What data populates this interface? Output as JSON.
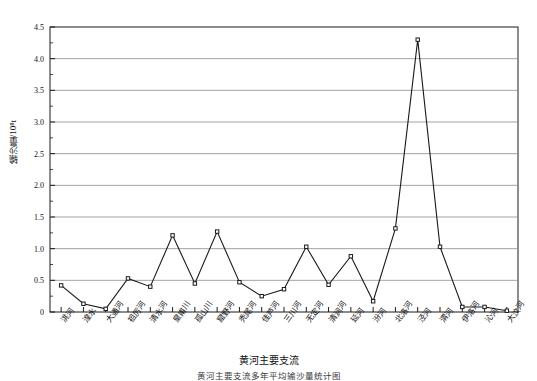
{
  "chart_data": {
    "type": "line",
    "title": "",
    "xlabel": "黄河主要支流",
    "ylabel": "输沙量/10⁸t",
    "ylim": [
      0,
      4.5
    ],
    "ytick_step": 0.5,
    "yminor_step": 0.25,
    "grid": "horizontal",
    "legend": "none",
    "marker": "open-square",
    "line_color": "#1a1a1a",
    "grid_color": "#8c8c8c",
    "categories": [
      "洮河",
      "湟水",
      "大通河",
      "祖厉河",
      "清水河",
      "皇甫川",
      "孤山川",
      "窟野河",
      "秃尾河",
      "佳芦河",
      "三川河",
      "无定河",
      "清涧河",
      "延河",
      "汾河",
      "北洛河",
      "泾河",
      "渭河",
      "伊洛河",
      "沁河",
      "大汶河"
    ],
    "yticks": [
      "0",
      "0.5",
      "1.0",
      "1.5",
      "2.0",
      "2.5",
      "3.0",
      "3.5",
      "4.0",
      "4.5"
    ],
    "values": [
      0.42,
      0.13,
      0.05,
      0.53,
      0.4,
      1.21,
      0.45,
      1.27,
      0.47,
      0.25,
      0.36,
      1.03,
      0.43,
      0.88,
      0.17,
      1.32,
      4.3,
      1.03,
      0.08,
      0.08,
      0.02
    ]
  },
  "caption": {
    "text": "黄河主要支流多年平均输沙量统计图"
  }
}
